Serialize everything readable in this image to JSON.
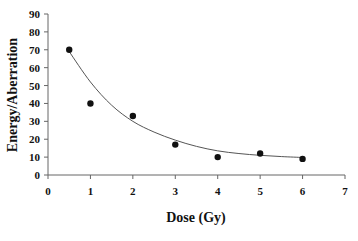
{
  "chart_data": {
    "type": "scatter",
    "title": "",
    "xlabel": "Dose (Gy)",
    "ylabel": "Energy/Aberration",
    "xlim": [
      0,
      7
    ],
    "ylim": [
      0,
      90
    ],
    "x_ticks": [
      0,
      1,
      2,
      3,
      4,
      5,
      6,
      7
    ],
    "y_ticks": [
      0,
      10,
      20,
      30,
      40,
      50,
      60,
      70,
      80,
      90
    ],
    "grid": false,
    "legend": null,
    "series": [
      {
        "name": "measured",
        "type": "scatter",
        "marker": "filled-circle",
        "color": "#111111",
        "x": [
          0.5,
          1,
          2,
          3,
          4,
          5,
          6
        ],
        "y": [
          70,
          40,
          33,
          17,
          10,
          12,
          9
        ]
      },
      {
        "name": "fit",
        "type": "line",
        "color": "#555555",
        "x": [
          0.5,
          1,
          1.5,
          2,
          2.5,
          3,
          3.5,
          4,
          4.5,
          5,
          5.5,
          6
        ],
        "y": [
          69,
          52,
          39,
          30,
          24,
          19.5,
          16,
          13.5,
          12,
          11,
          10.3,
          9.8
        ]
      }
    ]
  }
}
